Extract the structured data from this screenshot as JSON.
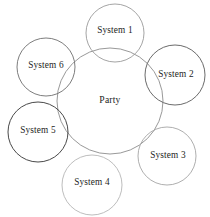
{
  "diagram": {
    "type": "venn-cluster",
    "canvas": {
      "width": 210,
      "height": 217,
      "background": "#ffffff"
    },
    "center": {
      "label": "Party",
      "cx": 110,
      "cy": 101,
      "r": 53,
      "stroke": "#8d8d8d",
      "stroke_width": 0.9
    },
    "nodes": [
      {
        "id": "system-1",
        "label": "System 1",
        "cx": 115,
        "cy": 33,
        "r": 29,
        "stroke": "#9a9a9a",
        "stroke_width": 0.9,
        "label_x": 115,
        "label_y": 31
      },
      {
        "id": "system-2",
        "label": "System 2",
        "cx": 175,
        "cy": 75,
        "r": 30,
        "stroke": "#5a5a5a",
        "stroke_width": 0.9,
        "label_x": 176,
        "label_y": 75
      },
      {
        "id": "system-3",
        "label": "System 3",
        "cx": 167,
        "cy": 156,
        "r": 29,
        "stroke": "#a5a5a5",
        "stroke_width": 0.9,
        "label_x": 168,
        "label_y": 156
      },
      {
        "id": "system-4",
        "label": "System 4",
        "cx": 92,
        "cy": 185,
        "r": 30,
        "stroke": "#b6b6b6",
        "stroke_width": 0.9,
        "label_x": 92,
        "label_y": 183
      },
      {
        "id": "system-5",
        "label": "System 5",
        "cx": 38,
        "cy": 132,
        "r": 30,
        "stroke": "#3f3f3f",
        "stroke_width": 0.95,
        "label_x": 38,
        "label_y": 131
      },
      {
        "id": "system-6",
        "label": "System 6",
        "cx": 46,
        "cy": 67,
        "r": 29,
        "stroke": "#6e6e6e",
        "stroke_width": 0.9,
        "label_x": 46,
        "label_y": 66
      }
    ]
  }
}
